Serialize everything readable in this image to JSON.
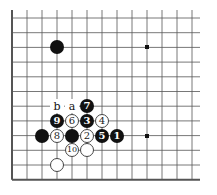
{
  "board": {
    "grid": {
      "origin_x": 12,
      "origin_y": 18,
      "spacing_x": 15,
      "spacing_y": 14.7,
      "cols": 13,
      "rows": 12,
      "left_edge": true,
      "bottom_edge": true,
      "line_color": "#555555"
    },
    "hoshi": [
      {
        "col": 9,
        "row": 2
      },
      {
        "col": 9,
        "row": 8
      }
    ],
    "stones": [
      {
        "color": "black",
        "col": 3,
        "row": 2,
        "label": ""
      },
      {
        "color": "black",
        "col": 5,
        "row": 6,
        "label": "7"
      },
      {
        "color": "black",
        "col": 3,
        "row": 7,
        "label": "9"
      },
      {
        "color": "white",
        "col": 4,
        "row": 7,
        "label": "6"
      },
      {
        "color": "black",
        "col": 5,
        "row": 7,
        "label": "3"
      },
      {
        "color": "white",
        "col": 6,
        "row": 7,
        "label": "4"
      },
      {
        "color": "black",
        "col": 2,
        "row": 8,
        "label": ""
      },
      {
        "color": "white",
        "col": 3,
        "row": 8,
        "label": "8"
      },
      {
        "color": "black",
        "col": 4,
        "row": 8,
        "label": ""
      },
      {
        "color": "white",
        "col": 5,
        "row": 8,
        "label": "2"
      },
      {
        "color": "black",
        "col": 6,
        "row": 8,
        "label": "5"
      },
      {
        "color": "black",
        "col": 7,
        "row": 8,
        "label": "1"
      },
      {
        "color": "white",
        "col": 4,
        "row": 9,
        "label": "10"
      },
      {
        "color": "white",
        "col": 5,
        "row": 9,
        "label": ""
      },
      {
        "color": "white",
        "col": 3,
        "row": 10,
        "label": ""
      }
    ],
    "labels": [
      {
        "col": 3,
        "row": 6,
        "text": "b"
      },
      {
        "col": 4,
        "row": 6,
        "text": "a"
      }
    ]
  }
}
